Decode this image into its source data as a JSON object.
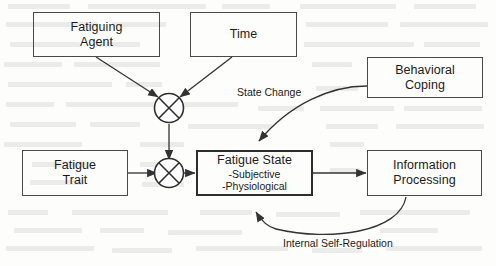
{
  "diagram": {
    "background_color": "#fdfdfc",
    "stroke_color": "#4a4a4a",
    "text_color": "#1b1b1b",
    "nodes": [
      {
        "id": "fatiguing_agent",
        "label": "Fatiguing\nAgent",
        "line1": "Fatiguing",
        "line2": "Agent"
      },
      {
        "id": "time",
        "label": "Time",
        "line1": "Time",
        "line2": ""
      },
      {
        "id": "behavioral_coping",
        "label": "Behavioral\nCoping",
        "line1": "Behavioral",
        "line2": "Coping"
      },
      {
        "id": "fatigue_trait",
        "label": "Fatigue\nTrait",
        "line1": "Fatigue",
        "line2": "Trait"
      },
      {
        "id": "fatigue_state",
        "label": "Fatigue State",
        "line1": "Fatigue State",
        "sub1": "-Subjective",
        "sub2": "-Physiological"
      },
      {
        "id": "information_processing",
        "label": "Information\nProcessing",
        "line1": "Information",
        "line2": "Processing"
      }
    ],
    "operators": [
      {
        "id": "combiner_top",
        "symbol": "crossed-circle"
      },
      {
        "id": "combiner_bottom",
        "symbol": "crossed-circle"
      }
    ],
    "edge_labels": [
      {
        "id": "state_change",
        "text": "State Change"
      },
      {
        "id": "internal_self_regulation",
        "text": "Internal Self-Regulation"
      }
    ]
  }
}
